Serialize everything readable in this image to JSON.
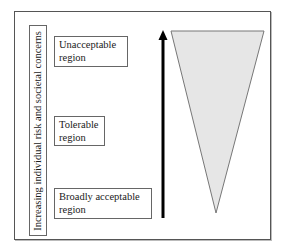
{
  "diagram": {
    "type": "ALARP risk triangle",
    "axis_label": "Increasing individual risk and societal concerns",
    "regions": [
      {
        "line1": "Unacceptable",
        "line2": "region"
      },
      {
        "line1": "Tolerable",
        "line2": "region"
      },
      {
        "line1": "Broadly acceptable",
        "line2": "region"
      }
    ],
    "arrow": {
      "direction": "up",
      "color": "#000000"
    },
    "triangle": {
      "orientation": "inverted",
      "fill": "#e6e6e6",
      "stroke": "#777777"
    }
  }
}
